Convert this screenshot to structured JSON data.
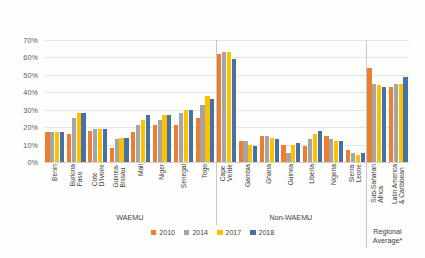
{
  "chart_data": {
    "type": "bar",
    "title": "",
    "xlabel": "",
    "ylabel": "",
    "ylim": [
      0,
      70
    ],
    "ytick_labels": [
      "0%",
      "10%",
      "20%",
      "30%",
      "40%",
      "50%",
      "60%",
      "70%"
    ],
    "ytick_values": [
      0,
      10,
      20,
      30,
      40,
      50,
      60,
      70
    ],
    "grid": true,
    "legend_position": "bottom",
    "categories": [
      "Benin",
      "Burkina\nFaso",
      "Cote\nD'Ivoire",
      "Guinea-\nBissau",
      "Mali",
      "Niger",
      "Senegal",
      "Togo",
      "Cape\nVerde",
      "Gambia",
      "Ghana",
      "Guinea",
      "Liberia",
      "Nigeria",
      "Sierra\nLeone",
      "Sub-Saharan\nAfrica",
      "Latin America\n& Caribbean"
    ],
    "series": [
      {
        "name": "2010",
        "color": "#ed7d31",
        "values": [
          17,
          16,
          18,
          8,
          17,
          21,
          21,
          25,
          62,
          12,
          15,
          10,
          9,
          15,
          7,
          54,
          43
        ]
      },
      {
        "name": "2014",
        "color": "#a5a5a5",
        "values": [
          17,
          25,
          19,
          13,
          21,
          24,
          28,
          33,
          63,
          12,
          15,
          5,
          13,
          13,
          5,
          45,
          45
        ]
      },
      {
        "name": "2017",
        "color": "#ffc000",
        "values": [
          17,
          28,
          19,
          14,
          24,
          27,
          30,
          38,
          63,
          10,
          14,
          10,
          16,
          12,
          4,
          44,
          45
        ]
      },
      {
        "name": "2018",
        "color": "#4472a8",
        "values": [
          17,
          28,
          19,
          14,
          27,
          27,
          30,
          36,
          59,
          9,
          13,
          11,
          18,
          12,
          5,
          43,
          49
        ]
      }
    ],
    "group_labels": [
      {
        "label": "WAEMU",
        "start_index": 0,
        "end_index": 7
      },
      {
        "label": "Non-WAEMU",
        "start_index": 8,
        "end_index": 14
      },
      {
        "label": "Regional\nAverage*",
        "start_index": 15,
        "end_index": 16
      }
    ],
    "group_separator_indices": [
      8,
      15
    ]
  }
}
